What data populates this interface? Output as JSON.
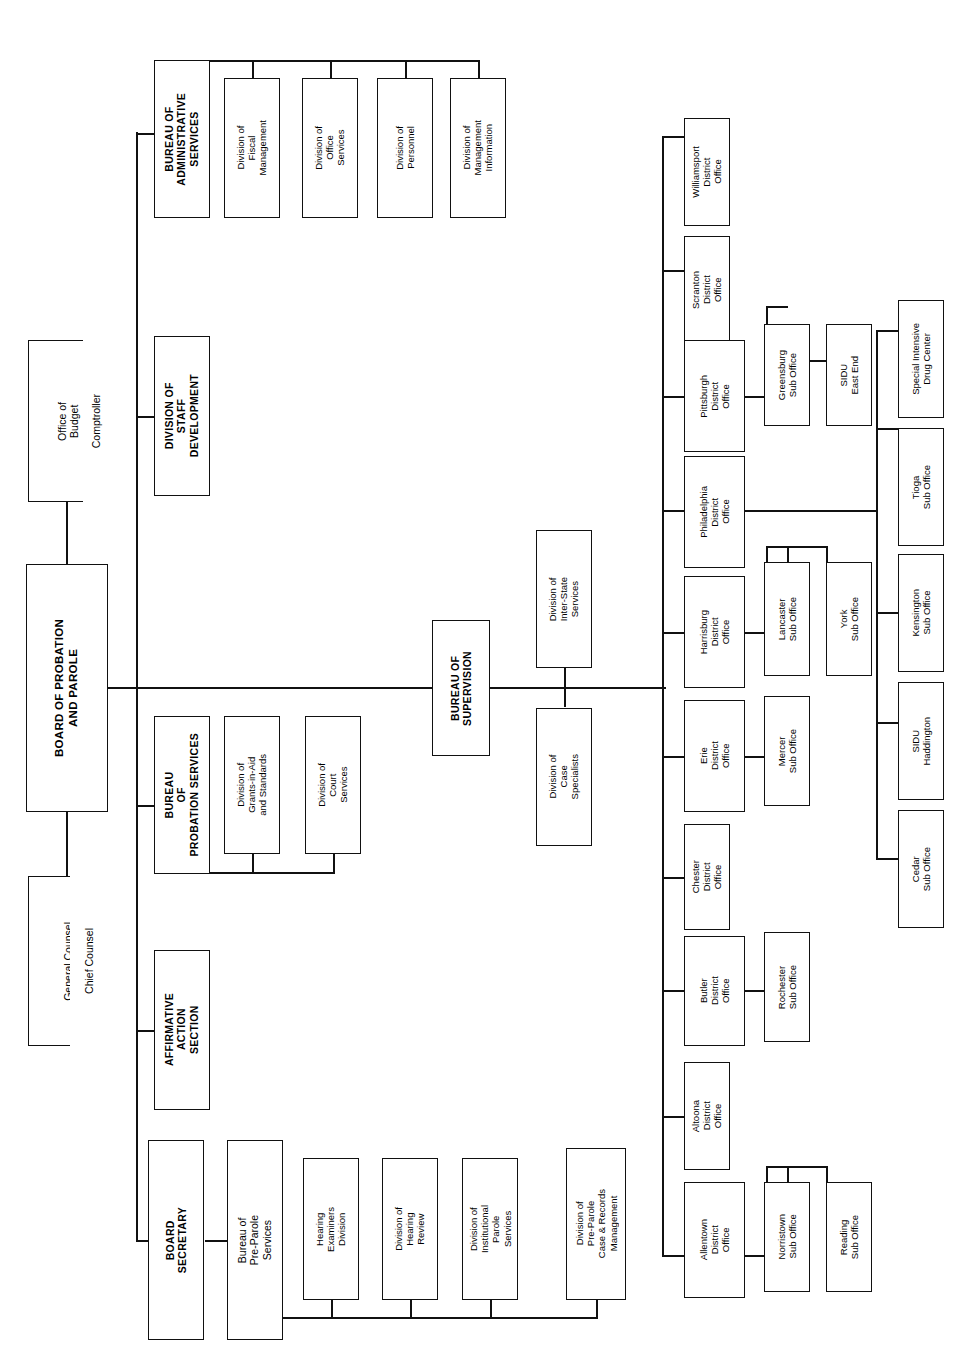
{
  "chart": {
    "orientation": "rotated-90",
    "line_color": "#111111",
    "box_border_color": "#111111",
    "background": "#ffffff"
  },
  "nodes": {
    "office_of_budget": "Office of\nBudget",
    "comptroller": "Comptroller",
    "board": "BOARD OF PROBATION\nAND PAROLE",
    "general_counsel": "General Counsel",
    "chief_counsel": "Chief Counsel",
    "bureau_admin": "BUREAU OF\nADMINISTRATIVE\nSERVICES",
    "div_fiscal": "Division of\nFiscal\nManagement",
    "div_office_services": "Division of\nOffice\nServices",
    "div_personnel": "Division of\nPersonnel",
    "div_mgmt_info": "Division of\nManagement\nInformation",
    "div_staff_dev": "DIVISION OF\nSTAFF\nDEVELOPMENT",
    "bureau_probation": "BUREAU\nOF\nPROBATION SERVICES",
    "div_grants": "Division of\nGrants-in-Aid\nand Standards",
    "div_court_services": "Division of\nCourt\nServices",
    "affirmative_action": "AFFIRMATIVE\nACTION\nSECTION",
    "board_secretary": "BOARD\nSECRETARY",
    "bureau_preparole": "Bureau of\nPre-Parole\nServices",
    "hearing_examiners": "Hearing\nExaminers\nDivision",
    "div_hearing_review": "Division of\nHearing\nReview",
    "div_institutional": "Division of\nInstitutional\nParole\nServices",
    "div_preparole_case": "Division of\nPre-Parole\nCase & Records\nManagement",
    "bureau_supervision": "BUREAU OF\nSUPERVISION",
    "div_interstate": "Division of\nInter-State\nServices",
    "div_case_specialists": "Division of\nCase\nSpecialists",
    "williamsport": "Williamsport\nDistrict\nOffice",
    "scranton": "Scranton\nDistrict\nOffice",
    "pittsburgh": "Pittsburgh\nDistrict\nOffice",
    "philadelphia": "Philadelphia\nDistrict\nOffice",
    "harrisburg": "Harrisburg\nDistrict\nOffice",
    "erie": "Erie\nDistrict\nOffice",
    "chester": "Chester\nDistrict\nOffice",
    "butler": "Butler\nDistrict\nOffice",
    "altoona": "Altoona\nDistrict\nOffice",
    "allentown": "Allentown\nDistrict\nOffice",
    "greensburg": "Greensburg\nSub Office",
    "sidu_east_end": "SIDU\nEast End",
    "special_intensive": "Special Intensive\nDrug Center",
    "tioga": "Tioga\nSub Office",
    "kensington": "Kensington\nSub Office",
    "sidu_haddington": "SIDU\nHaddington",
    "cedar": "Cedar\nSub Office",
    "lancaster": "Lancaster\nSub Office",
    "york": "York\nSub Office",
    "mercer": "Mercer\nSub Office",
    "rochester": "Rochester\nSub Office",
    "norristown": "Norristown\nSub Office",
    "reading": "Reading\nSub Office"
  },
  "hierarchy": {
    "root": "board",
    "staff_units": [
      "office_of_budget",
      "general_counsel"
    ],
    "board_children": [
      "bureau_admin",
      "div_staff_dev",
      "bureau_probation",
      "affirmative_action",
      "board_secretary",
      "bureau_supervision"
    ],
    "bureau_admin_children": [
      "div_fiscal",
      "div_office_services",
      "div_personnel",
      "div_mgmt_info"
    ],
    "bureau_probation_children": [
      "div_grants",
      "div_court_services"
    ],
    "board_secretary_children": [
      "bureau_preparole"
    ],
    "bureau_preparole_children": [
      "hearing_examiners",
      "div_hearing_review",
      "div_institutional",
      "div_preparole_case"
    ],
    "bureau_supervision_children": [
      "div_interstate",
      "div_case_specialists"
    ],
    "district_offices": [
      "williamsport",
      "scranton",
      "pittsburgh",
      "philadelphia",
      "harrisburg",
      "erie",
      "chester",
      "butler",
      "altoona",
      "allentown"
    ],
    "pittsburgh_children": [
      "greensburg",
      "sidu_east_end"
    ],
    "philadelphia_children": [
      "special_intensive",
      "tioga",
      "kensington",
      "sidu_haddington",
      "cedar"
    ],
    "harrisburg_children": [
      "lancaster",
      "york"
    ],
    "erie_children": [
      "mercer"
    ],
    "butler_children": [
      "rochester"
    ],
    "allentown_children": [
      "norristown",
      "reading"
    ]
  }
}
